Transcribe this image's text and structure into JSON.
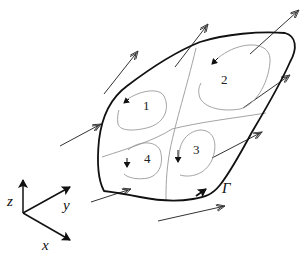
{
  "diagram": {
    "colors": {
      "boundary": "#111111",
      "divider": "#999999",
      "vortex": "#999999",
      "flow_arrow": "#333333",
      "axis": "#111111",
      "background": "#ffffff"
    },
    "boundary_label": "Γ",
    "regions": [
      {
        "id": "1",
        "label": "1"
      },
      {
        "id": "2",
        "label": "2"
      },
      {
        "id": "3",
        "label": "3"
      },
      {
        "id": "4",
        "label": "4"
      }
    ],
    "axes": {
      "x_label": "x",
      "y_label": "y",
      "z_label": "z"
    },
    "flow_arrows_count": 7,
    "arrow_head_style": "double-open-arrowhead"
  }
}
